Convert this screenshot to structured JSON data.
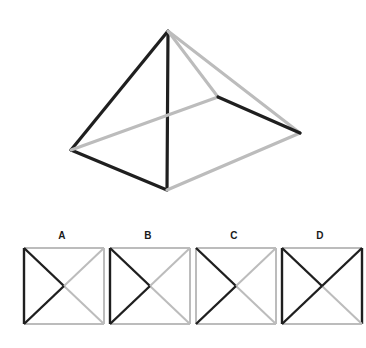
{
  "page": {
    "background_color": "#ffffff",
    "width": 366,
    "height": 348
  },
  "colors": {
    "dark_edge": "#1f1f1f",
    "light_edge": "#bcbcbc",
    "mid_edge": "#9a9a9a",
    "label_text": "#1a1a1a",
    "background": "#ffffff"
  },
  "stimulus": {
    "name": "pyramid-wireframe",
    "description": "Wireframe square pyramid drawn in oblique view with some edges dark and some edges light grey",
    "vertices": {
      "apex": [
        168,
        31
      ],
      "left": [
        71,
        150
      ],
      "front": [
        167,
        190
      ],
      "right": [
        300,
        133
      ],
      "back": [
        218,
        97
      ]
    },
    "edges": [
      {
        "name": "apex-to-left",
        "from": "apex",
        "to": "left",
        "shade": "dark",
        "width": 3.2
      },
      {
        "name": "apex-to-front",
        "from": "apex",
        "to": "front",
        "shade": "dark",
        "width": 3.2
      },
      {
        "name": "left-to-front",
        "from": "left",
        "to": "front",
        "shade": "dark",
        "width": 3.2
      },
      {
        "name": "front-to-right",
        "from": "front",
        "to": "right",
        "shade": "light",
        "width": 3.2
      },
      {
        "name": "apex-to-back",
        "from": "apex",
        "to": "back",
        "shade": "light",
        "width": 3.0
      },
      {
        "name": "apex-to-right",
        "from": "apex",
        "to": "right",
        "shade": "light",
        "width": 3.0
      },
      {
        "name": "left-to-back",
        "from": "left",
        "to": "back",
        "shade": "light",
        "width": 3.0
      },
      {
        "name": "back-to-right",
        "from": "back",
        "to": "right",
        "shade": "dark",
        "width": 3.2
      }
    ]
  },
  "options": {
    "name": "answer-options",
    "count": 4,
    "items": [
      {
        "label": "A",
        "name": "option-a",
        "box": {
          "width": 80,
          "height": 76
        },
        "lines": [
          {
            "name": "top-edge",
            "shade": "light",
            "x1": 0,
            "y1": 0,
            "x2": 80,
            "y2": 0
          },
          {
            "name": "left-edge",
            "shade": "dark",
            "x1": 0,
            "y1": 0,
            "x2": 0,
            "y2": 76
          },
          {
            "name": "right-edge",
            "shade": "light",
            "x1": 80,
            "y1": 0,
            "x2": 80,
            "y2": 76
          },
          {
            "name": "bottom-edge",
            "shade": "light",
            "x1": 0,
            "y1": 76,
            "x2": 80,
            "y2": 76
          },
          {
            "name": "diag-tl-center",
            "shade": "dark",
            "x1": 0,
            "y1": 0,
            "x2": 40,
            "y2": 38
          },
          {
            "name": "diag-center-br",
            "shade": "light",
            "x1": 40,
            "y1": 38,
            "x2": 80,
            "y2": 76
          },
          {
            "name": "diag-bl-center",
            "shade": "dark",
            "x1": 0,
            "y1": 76,
            "x2": 40,
            "y2": 38
          },
          {
            "name": "diag-center-tr",
            "shade": "light",
            "x1": 40,
            "y1": 38,
            "x2": 80,
            "y2": 0
          }
        ]
      },
      {
        "label": "B",
        "name": "option-b",
        "box": {
          "width": 80,
          "height": 76
        },
        "lines": [
          {
            "name": "top-edge",
            "shade": "light",
            "x1": 0,
            "y1": 0,
            "x2": 80,
            "y2": 0
          },
          {
            "name": "left-edge",
            "shade": "dark",
            "x1": 0,
            "y1": 0,
            "x2": 0,
            "y2": 76
          },
          {
            "name": "right-edge",
            "shade": "light",
            "x1": 80,
            "y1": 0,
            "x2": 80,
            "y2": 76
          },
          {
            "name": "bottom-edge",
            "shade": "light",
            "x1": 0,
            "y1": 76,
            "x2": 80,
            "y2": 76
          },
          {
            "name": "diag-tl-center",
            "shade": "dark",
            "x1": 0,
            "y1": 0,
            "x2": 40,
            "y2": 38
          },
          {
            "name": "diag-center-br",
            "shade": "light",
            "x1": 40,
            "y1": 38,
            "x2": 80,
            "y2": 76
          },
          {
            "name": "diag-bl-center",
            "shade": "dark",
            "x1": 0,
            "y1": 76,
            "x2": 40,
            "y2": 38
          },
          {
            "name": "diag-center-tr",
            "shade": "light",
            "x1": 40,
            "y1": 38,
            "x2": 80,
            "y2": 0
          }
        ]
      },
      {
        "label": "C",
        "name": "option-c",
        "box": {
          "width": 80,
          "height": 76
        },
        "lines": [
          {
            "name": "top-edge",
            "shade": "light",
            "x1": 0,
            "y1": 0,
            "x2": 80,
            "y2": 0
          },
          {
            "name": "left-edge",
            "shade": "light",
            "x1": 0,
            "y1": 0,
            "x2": 0,
            "y2": 76
          },
          {
            "name": "right-edge",
            "shade": "light",
            "x1": 80,
            "y1": 0,
            "x2": 80,
            "y2": 76
          },
          {
            "name": "bottom-edge",
            "shade": "light",
            "x1": 0,
            "y1": 76,
            "x2": 80,
            "y2": 76
          },
          {
            "name": "diag-tl-center",
            "shade": "dark",
            "x1": 0,
            "y1": 0,
            "x2": 40,
            "y2": 38
          },
          {
            "name": "diag-center-br",
            "shade": "light",
            "x1": 40,
            "y1": 38,
            "x2": 80,
            "y2": 76
          },
          {
            "name": "diag-bl-center",
            "shade": "dark",
            "x1": 0,
            "y1": 76,
            "x2": 40,
            "y2": 38
          },
          {
            "name": "diag-center-tr",
            "shade": "light",
            "x1": 40,
            "y1": 38,
            "x2": 80,
            "y2": 0
          }
        ]
      },
      {
        "label": "D",
        "name": "option-d",
        "box": {
          "width": 80,
          "height": 76
        },
        "lines": [
          {
            "name": "top-edge",
            "shade": "light",
            "x1": 0,
            "y1": 0,
            "x2": 80,
            "y2": 0
          },
          {
            "name": "left-edge",
            "shade": "dark",
            "x1": 0,
            "y1": 0,
            "x2": 0,
            "y2": 76
          },
          {
            "name": "right-edge",
            "shade": "dark",
            "x1": 80,
            "y1": 0,
            "x2": 80,
            "y2": 76
          },
          {
            "name": "bottom-edge",
            "shade": "light",
            "x1": 0,
            "y1": 76,
            "x2": 80,
            "y2": 76
          },
          {
            "name": "diag-tl-center",
            "shade": "dark",
            "x1": 0,
            "y1": 0,
            "x2": 40,
            "y2": 38
          },
          {
            "name": "diag-center-br",
            "shade": "light",
            "x1": 40,
            "y1": 38,
            "x2": 80,
            "y2": 76
          },
          {
            "name": "diag-bl-center",
            "shade": "dark",
            "x1": 0,
            "y1": 76,
            "x2": 40,
            "y2": 38
          },
          {
            "name": "diag-center-tr",
            "shade": "dark",
            "x1": 40,
            "y1": 38,
            "x2": 80,
            "y2": 0
          }
        ]
      }
    ]
  }
}
